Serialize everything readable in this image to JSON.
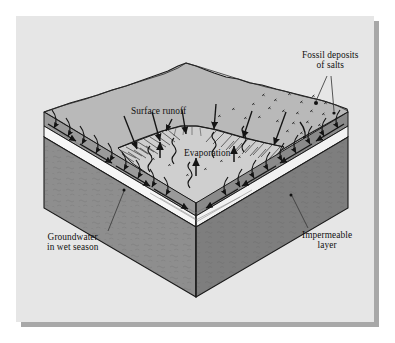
{
  "figure": {
    "kind": "block-diagram",
    "labels": {
      "fossil_deposits_line1": "Fossil deposits",
      "fossil_deposits_line2": "of salts",
      "surface_runoff": "Surface runoff",
      "evaporation": "Evaporation",
      "groundwater_line1": "Groundwater",
      "groundwater_line2": "in wet season",
      "impermeable_line1": "Impermeable",
      "impermeable_line2": "layer"
    },
    "colors": {
      "page": "#ffffff",
      "panel_background": "#e6e6e6",
      "panel_shadow": "#a8a8a8",
      "top_surface": "#b9b9b9",
      "basin_floor": "#cfcfcf",
      "soil_layer": "#9a9a9a",
      "aquifer_layer": "#f6f6f6",
      "impermeable_front": "#8e8e8e",
      "impermeable_side": "#7e7e7e",
      "outline": "#1a1a1a",
      "label_text": "#111111"
    },
    "elements": {
      "runoff_arrows": 8,
      "evaporation_arrows": 3,
      "vapor_squiggles": 5,
      "infiltration_arrows_left": 9,
      "infiltration_arrows_right": 9,
      "groundwater_flow_arrows": 6,
      "salt_marks": 22,
      "salt_dots": 2,
      "leader_lines": 4
    }
  }
}
